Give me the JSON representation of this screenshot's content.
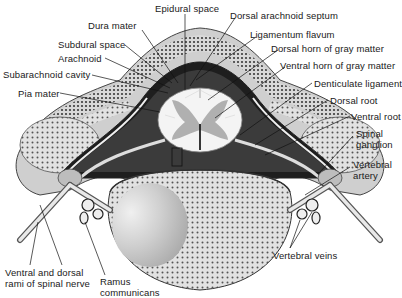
{
  "figure": {
    "labels": [
      {
        "id": "epidural-space",
        "text": "Epidural space",
        "x": 155,
        "y": 3
      },
      {
        "id": "dura-mater",
        "text": "Dura mater",
        "x": 88,
        "y": 20
      },
      {
        "id": "dorsal-arachnoid-septum",
        "text": "Dorsal arachnoid septum",
        "x": 230,
        "y": 10
      },
      {
        "id": "ligamentum-flavum",
        "text": "Ligamentum flavum",
        "x": 250,
        "y": 29
      },
      {
        "id": "subdural-space",
        "text": "Subdural space",
        "x": 58,
        "y": 39
      },
      {
        "id": "dorsal-horn",
        "text": "Dorsal horn of gray matter",
        "x": 271,
        "y": 43
      },
      {
        "id": "arachnoid",
        "text": "Arachnoid",
        "x": 58,
        "y": 53
      },
      {
        "id": "subarachnoid-cavity",
        "text": "Subarachnoid cavity",
        "x": 3,
        "y": 69
      },
      {
        "id": "ventral-horn",
        "text": "Ventral horn of gray matter",
        "x": 280,
        "y": 60
      },
      {
        "id": "pia-mater",
        "text": "Pia mater",
        "x": 18,
        "y": 88
      },
      {
        "id": "denticulate-ligament",
        "text": "Denticulate ligament",
        "x": 314,
        "y": 78
      },
      {
        "id": "dorsal-root",
        "text": "Dorsal root",
        "x": 330,
        "y": 95
      },
      {
        "id": "ventral-root",
        "text": "Ventral root",
        "x": 351,
        "y": 111
      },
      {
        "id": "spinal-ganglion",
        "text": "Spinal\nganglion",
        "x": 356,
        "y": 128
      },
      {
        "id": "vertebral-artery",
        "text": "Vertebral\nartery",
        "x": 353,
        "y": 159
      },
      {
        "id": "vertebral-veins",
        "text": "Vertebral veins",
        "x": 273,
        "y": 250
      },
      {
        "id": "ventral-dorsal-rami",
        "text": "Ventral and dorsal\nrami of spinal nerve",
        "x": 5,
        "y": 267
      },
      {
        "id": "ramus-communicans",
        "text": "Ramus\ncommunicans",
        "x": 100,
        "y": 276
      }
    ]
  }
}
